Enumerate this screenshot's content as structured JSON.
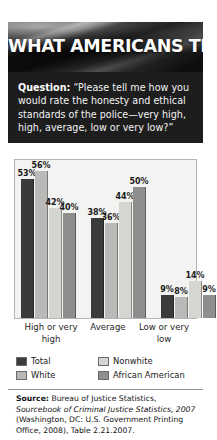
{
  "header": {
    "title": "WHAT AMERICANS THINK",
    "background_image": "american-flag-grayscale"
  },
  "question": {
    "label": "Question:",
    "text": " “Please tell me how you would rate the honesty and ethical standards of the police—very high, high, average, low or very low?”"
  },
  "chart_data": {
    "type": "bar",
    "title": "",
    "xlabel": "",
    "ylabel": "",
    "ylim": [
      0,
      60
    ],
    "grid": false,
    "legend_position": "bottom-left",
    "value_suffix": "%",
    "categories": [
      "High or very high",
      "Average",
      "Low or very low"
    ],
    "series": [
      {
        "name": "Total",
        "color": "#3b3b3b",
        "values": [
          53,
          38,
          9
        ]
      },
      {
        "name": "White",
        "color": "#b9b9b7",
        "values": [
          56,
          36,
          8
        ]
      },
      {
        "name": "Nonwhite",
        "color": "#d5d5d2",
        "values": [
          42,
          44,
          14
        ]
      },
      {
        "name": "African American",
        "color": "#8e8e8c",
        "values": [
          40,
          50,
          9
        ]
      }
    ],
    "labels": [
      [
        "53%",
        "56%",
        "42%",
        "40%"
      ],
      [
        "38%",
        "36%",
        "44%",
        "50%"
      ],
      [
        "9%",
        "8%",
        "14%",
        "9%"
      ]
    ]
  },
  "legend": {
    "items": [
      {
        "label": "Total",
        "color": "#3b3b3b"
      },
      {
        "label": "Nonwhite",
        "color": "#d5d5d2"
      },
      {
        "label": "White",
        "color": "#b9b9b7"
      },
      {
        "label": "African American",
        "color": "#8e8e8c"
      }
    ]
  },
  "source": {
    "label": "Source:",
    "part1": " Bureau of Justice Statistics, ",
    "italic1": "Sourcebook of Criminal Justice Statistics, 2007",
    "part2": " (Washington, DC: U.S. Government Printing Office, 2008), Table 2.21.2007."
  }
}
